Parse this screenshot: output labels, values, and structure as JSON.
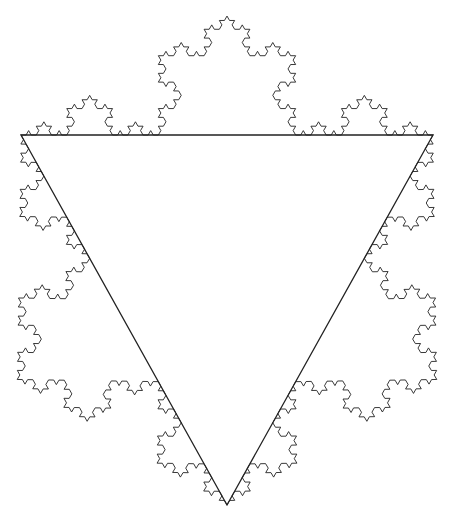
{
  "figure": {
    "type": "koch-snowflake-outward-on-triangle",
    "background": "#ffffff",
    "stroke_color": "#222222",
    "triangle": {
      "vertices": [
        [
          21,
          135
        ],
        [
          433,
          135
        ],
        [
          227,
          505
        ]
      ],
      "stroke_width": 1.3
    },
    "koch": {
      "level": 4,
      "stroke_width": 0.9,
      "direction": "outward"
    }
  }
}
